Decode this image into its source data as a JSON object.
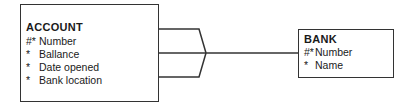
{
  "diagram": {
    "entities": [
      {
        "id": "account",
        "name": "ACCOUNT",
        "attributes": [
          {
            "marker": "#*",
            "label": "Number"
          },
          {
            "marker": "*",
            "label": "Ballance"
          },
          {
            "marker": "*",
            "label": "Date opened"
          },
          {
            "marker": "*",
            "label": "Bank location"
          }
        ]
      },
      {
        "id": "bank",
        "name": "BANK",
        "attributes": [
          {
            "marker": "#*",
            "label": "Number"
          },
          {
            "marker": "*",
            "label": "Name"
          }
        ]
      }
    ],
    "relationships": [
      {
        "from": "account",
        "to": "bank",
        "from_cardinality": "many",
        "to_cardinality": "one"
      }
    ]
  }
}
